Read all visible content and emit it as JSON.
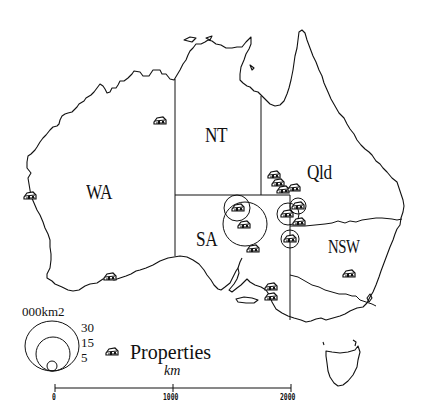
{
  "map": {
    "title": "Properties",
    "states": [
      {
        "id": "wa",
        "label": "WA",
        "x": 83,
        "y": 183
      },
      {
        "id": "nt",
        "label": "NT",
        "x": 207,
        "y": 126
      },
      {
        "id": "qld",
        "label": "Qld",
        "x": 308,
        "y": 162
      },
      {
        "id": "sa",
        "label": "SA",
        "x": 196,
        "y": 228
      },
      {
        "id": "nsw",
        "label": "NSW",
        "x": 328,
        "y": 236
      }
    ],
    "colors": {
      "ink": "#111111",
      "background": "#ffffff"
    }
  },
  "legend": {
    "title": "000km2",
    "circle_sizes": [
      {
        "label": "30",
        "value": 30
      },
      {
        "label": "15",
        "value": 15
      },
      {
        "label": "5",
        "value": 5
      }
    ],
    "symbol_icon": "house-icon",
    "symbol_label": "Properties"
  },
  "scale_bar": {
    "unit": "km",
    "ticks": [
      {
        "label": "0",
        "value": 0
      },
      {
        "label": "1000",
        "value": 1000
      },
      {
        "label": "2000",
        "value": 2000
      }
    ]
  },
  "properties": [
    {
      "x": 160,
      "y": 121,
      "size": null
    },
    {
      "x": 238,
      "y": 209,
      "size": 15
    },
    {
      "x": 245,
      "y": 224,
      "size": 30
    },
    {
      "x": 253,
      "y": 249,
      "size": null
    },
    {
      "x": 275,
      "y": 176,
      "size": null
    },
    {
      "x": 279,
      "y": 184,
      "size": null
    },
    {
      "x": 283,
      "y": 191,
      "size": null
    },
    {
      "x": 293,
      "y": 188,
      "size": null
    },
    {
      "x": 298,
      "y": 206,
      "size": 10
    },
    {
      "x": 287,
      "y": 214,
      "size": 15
    },
    {
      "x": 299,
      "y": 222,
      "size": null
    },
    {
      "x": 290,
      "y": 239,
      "size": 10
    },
    {
      "x": 349,
      "y": 273,
      "size": null
    },
    {
      "x": 270,
      "y": 293,
      "size": null
    },
    {
      "x": 270,
      "y": 297,
      "size": null
    },
    {
      "x": 110,
      "y": 276,
      "size": null
    },
    {
      "x": 30,
      "y": 196,
      "size": null
    },
    {
      "x": 268,
      "y": 294,
      "size": null
    }
  ]
}
